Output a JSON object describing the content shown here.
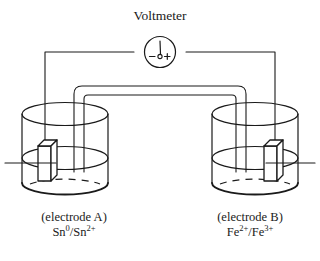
{
  "figure": {
    "title": "Voltmeter",
    "type": "galvanic-cell-diagram",
    "background_color": "#ffffff",
    "stroke_color": "#1a1a1a"
  },
  "voltmeter": {
    "label": "Voltmeter",
    "negative_terminal": "−",
    "positive_terminal": "+",
    "needle": "needle",
    "pivot": "pivot-dot"
  },
  "cells": {
    "left": {
      "caption": "(electrode A)",
      "couple_html": "Sn<sup>0</sup>/Sn<sup>2+</sup>",
      "couple_text": "Sn0/Sn2+",
      "electrode_name": "electrode-A",
      "pointer": "pointer-line-left"
    },
    "right": {
      "caption": "(electrode B)",
      "couple_html": "Fe<sup>2+</sup>/Fe<sup>3+</sup>",
      "couple_text": "Fe2+/Fe3+",
      "electrode_name": "electrode-B",
      "pointer": "pointer-line-right"
    }
  },
  "parts": {
    "salt_bridge": "salt-bridge",
    "wire_left": "wire-left",
    "wire_right": "wire-right",
    "beaker_left": "beaker-left",
    "beaker_right": "beaker-right",
    "liquid_level_left": "liquid-level-left",
    "liquid_level_right": "liquid-level-right"
  }
}
